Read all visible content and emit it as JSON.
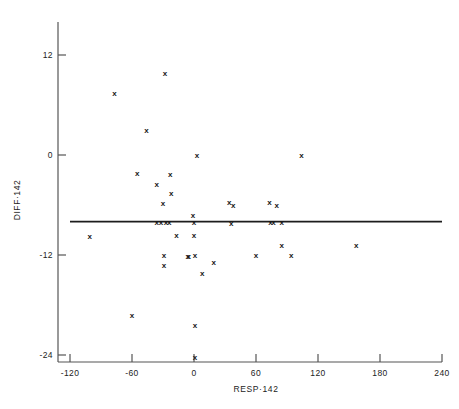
{
  "chart_data": {
    "type": "scatter",
    "title": "",
    "xlabel": "RESP·142",
    "ylabel": "DIFF·142",
    "xlim": [
      -120,
      240
    ],
    "ylim": [
      -24,
      16
    ],
    "xticks": [
      -120,
      -60,
      0,
      60,
      120,
      180,
      240
    ],
    "xticklabels": [
      "-120",
      "-60",
      "0",
      "60",
      "120",
      "180",
      "240"
    ],
    "yticks": [
      12,
      0,
      -12,
      -24
    ],
    "yticklabels": [
      "12",
      "0",
      "-12",
      "-24"
    ],
    "grid": false,
    "legend": null,
    "marker": "x",
    "marker_color": "#171717",
    "reference_line": {
      "type": "horizontal",
      "y": -8.0,
      "x_from": -120,
      "x_to": 240,
      "color": "#1d1d1d"
    },
    "points": [
      {
        "x": -28,
        "y": 9.8
      },
      {
        "x": -77,
        "y": 7.4
      },
      {
        "x": -46,
        "y": 3.0
      },
      {
        "x": 3,
        "y": 0.0
      },
      {
        "x": 104,
        "y": 0.0
      },
      {
        "x": -55,
        "y": -2.2
      },
      {
        "x": -23,
        "y": -2.3
      },
      {
        "x": -36,
        "y": -3.5
      },
      {
        "x": -22,
        "y": -4.6
      },
      {
        "x": -30,
        "y": -5.8
      },
      {
        "x": 34,
        "y": -5.6
      },
      {
        "x": 38,
        "y": -6.0
      },
      {
        "x": 73,
        "y": -5.6
      },
      {
        "x": 80,
        "y": -6.0
      },
      {
        "x": -1,
        "y": -7.2
      },
      {
        "x": -36,
        "y": -8.0
      },
      {
        "x": -32,
        "y": -8.0
      },
      {
        "x": -27,
        "y": -8.0
      },
      {
        "x": -24,
        "y": -8.0
      },
      {
        "x": 0,
        "y": -8.0
      },
      {
        "x": 36,
        "y": -8.2
      },
      {
        "x": 74,
        "y": -8.0
      },
      {
        "x": 77,
        "y": -8.0
      },
      {
        "x": 85,
        "y": -8.0
      },
      {
        "x": -101,
        "y": -9.7
      },
      {
        "x": -17,
        "y": -9.6
      },
      {
        "x": 0,
        "y": -9.6
      },
      {
        "x": 85,
        "y": -10.8
      },
      {
        "x": 157,
        "y": -10.8
      },
      {
        "x": -29,
        "y": -12.0
      },
      {
        "x": -6,
        "y": -12.1
      },
      {
        "x": -5,
        "y": -12.1
      },
      {
        "x": 1,
        "y": -12.0
      },
      {
        "x": 60,
        "y": -12.0
      },
      {
        "x": 94,
        "y": -12.0
      },
      {
        "x": -29,
        "y": -13.2
      },
      {
        "x": 19,
        "y": -12.9
      },
      {
        "x": 8,
        "y": -14.2
      },
      {
        "x": -60,
        "y": -19.2
      },
      {
        "x": 1,
        "y": -20.4
      },
      {
        "x": 1,
        "y": -24.2
      }
    ]
  },
  "figure": {
    "background": "#ffffff",
    "frame_color": "#555555"
  }
}
